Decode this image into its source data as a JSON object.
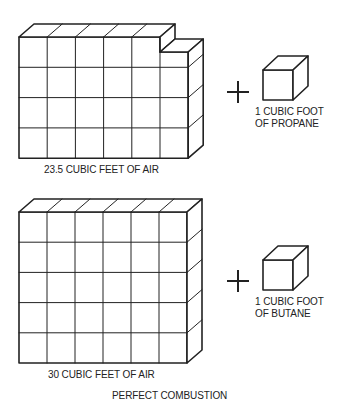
{
  "diagram": {
    "caption": "PERFECT COMBUSTION",
    "stroke_color": "#222222",
    "top_row": {
      "air_label": "23.5 CUBIC FEET OF AIR",
      "air_block": {
        "x": 19,
        "y": 37,
        "cols": 6,
        "rows": 4,
        "cell_w": 28.2,
        "cell_h": 30.3,
        "depth_dx": 15,
        "depth_dy": -13,
        "notch_col_top_y": 52
      },
      "operator": "+",
      "fuel_label_line1": "1 CUBIC FOOT",
      "fuel_label_line2": "OF PROPANE",
      "fuel_cube": {
        "x": 263,
        "y": 70,
        "size": 30,
        "depth_dx": 15,
        "depth_dy": -14
      }
    },
    "bottom_row": {
      "air_label": "30 CUBIC FEET OF AIR",
      "air_block": {
        "x": 19,
        "y": 212,
        "cols": 6,
        "rows": 5,
        "cell_w": 28,
        "cell_h": 30.2,
        "depth_dx": 15,
        "depth_dy": -13
      },
      "operator": "+",
      "fuel_label_line1": "1 CUBIC FOOT",
      "fuel_label_line2": "OF BUTANE",
      "fuel_cube": {
        "x": 263,
        "y": 260,
        "size": 30,
        "depth_dx": 15,
        "depth_dy": -14
      }
    }
  }
}
